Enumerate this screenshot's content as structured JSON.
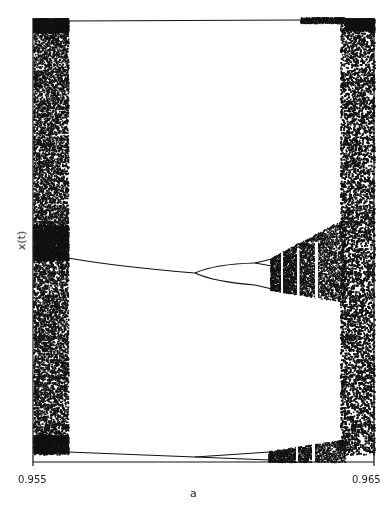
{
  "chart_data": {
    "type": "scatter",
    "title": "",
    "subtitle": "Bifurcation diagram",
    "xlabel": "a",
    "ylabel": "x(t)",
    "xlim": [
      0.955,
      0.965
    ],
    "x_ticks": [
      "0.955",
      "0.965"
    ],
    "grid": false,
    "legend": null,
    "features": {
      "left_chaotic_band": {
        "a_range": [
          0.955,
          0.956
        ],
        "x_range": "full"
      },
      "period_3_window_lines": [
        {
          "name": "top",
          "a_range": [
            0.956,
            0.964
          ],
          "x_position": "near top"
        },
        {
          "name": "middle",
          "a_range": [
            0.956,
            0.9597
          ],
          "x_position": "middle, slightly decreasing",
          "bifurcates_at": 0.9597
        },
        {
          "name": "bottom",
          "a_range": [
            0.956,
            0.9597
          ],
          "x_position": "near bottom",
          "bifurcates_at": 0.9597
        }
      ],
      "period_doubling_cascade": {
        "a_start": 0.9597,
        "a_onset_chaos": 0.9622
      },
      "right_chaotic_band": {
        "a_range": [
          0.9635,
          0.965
        ],
        "x_range": "full"
      }
    }
  },
  "axes": {
    "x_tick_left": "0.955",
    "x_tick_right": "0.965",
    "x_label": "a",
    "y_label": "x(t)"
  },
  "colors": {
    "ink": "#111111",
    "background": "#ffffff"
  }
}
